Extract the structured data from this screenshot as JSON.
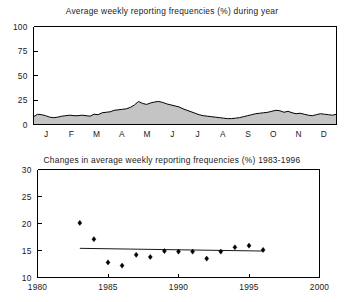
{
  "figure": {
    "background_color": "#ffffff",
    "ink_color": "#000000",
    "fill_color": "#c4c4c4"
  },
  "chart_data": [
    {
      "type": "area",
      "title": "Average weekly reporting frequencies (%) during year",
      "xlabel": "",
      "ylabel": "",
      "ylim": [
        0,
        100
      ],
      "yticks": [
        0,
        25,
        50,
        75,
        100
      ],
      "ytick_labels": [
        "0",
        "25",
        "50",
        "75",
        "100"
      ],
      "categories": [
        "J",
        "F",
        "M",
        "A",
        "M",
        "J",
        "J",
        "A",
        "S",
        "O",
        "N",
        "D"
      ],
      "xtick_labels": [
        "J",
        "F",
        "M",
        "A",
        "M",
        "J",
        "J",
        "A",
        "S",
        "O",
        "N",
        "D"
      ],
      "grid": false,
      "legend": "none",
      "x": [
        0.0,
        1.0,
        2.0,
        3.0,
        4.0,
        5.0,
        6.0,
        7.0,
        8.0,
        9.0,
        10.0,
        11.0,
        12.0,
        13.0,
        14.0,
        15.0,
        16.0,
        17.0,
        18.0,
        19.0,
        20.0,
        21.0,
        22.0,
        23.0,
        24.0,
        25.0,
        26.0,
        27.0,
        28.0,
        29.0,
        30.0,
        31.0,
        32.0,
        33.0,
        34.0,
        35.0,
        36.0,
        37.0,
        38.0,
        39.0,
        40.0,
        41.0,
        42.0,
        43.0,
        44.0,
        45.0,
        46.0,
        47.0,
        48.0,
        49.0,
        50.0,
        51.0
      ],
      "values": [
        8.0,
        10.5,
        10.0,
        9.0,
        7.5,
        7.0,
        7.5,
        8.5,
        9.0,
        9.5,
        9.0,
        9.0,
        9.5,
        9.0,
        8.5,
        10.5,
        10.0,
        12.0,
        12.5,
        13.0,
        14.5,
        15.0,
        15.5,
        16.0,
        17.5,
        20.0,
        23.5,
        21.5,
        20.5,
        22.0,
        23.0,
        23.5,
        22.5,
        21.0,
        20.0,
        19.0,
        18.0,
        16.0,
        14.5,
        13.0,
        11.5,
        10.0,
        9.0,
        8.5,
        8.0,
        7.5,
        7.0,
        6.5,
        6.0,
        6.0,
        6.5,
        7.0
      ],
      "values_tail": [
        8.0,
        9.0,
        10.0,
        11.0,
        11.5,
        12.0,
        12.5,
        13.5,
        14.5,
        14.0,
        12.5,
        13.5,
        12.0,
        11.0,
        11.5,
        10.5,
        9.5,
        9.0,
        10.0,
        11.0,
        10.5,
        10.0,
        9.5,
        10.5
      ],
      "series_note": "weekly values across the 12 months of the year",
      "peak_month": "May",
      "peak_value": 23.5,
      "min_value": 6.0
    },
    {
      "type": "scatter",
      "title": "Changes in average weekly reporting frequencies (%) 1983-1996",
      "xlabel": "",
      "ylabel": "",
      "xlim": [
        1980,
        2000
      ],
      "ylim": [
        10,
        30
      ],
      "yticks": [
        10,
        15,
        20,
        25,
        30
      ],
      "ytick_labels": [
        "10",
        "15",
        "20",
        "25",
        "30"
      ],
      "xticks": [
        1980,
        1985,
        1990,
        1995,
        2000
      ],
      "xtick_labels": [
        "1980",
        "1985",
        "1990",
        "1995",
        "2000"
      ],
      "grid": false,
      "legend": "none",
      "x": [
        1983,
        1984,
        1985,
        1986,
        1987,
        1988,
        1989,
        1990,
        1991,
        1992,
        1993,
        1994,
        1995,
        1996
      ],
      "values": [
        20.1,
        17.1,
        12.8,
        12.2,
        14.2,
        13.8,
        14.9,
        14.8,
        14.8,
        13.5,
        14.8,
        15.6,
        15.9,
        15.1
      ],
      "points": [
        {
          "year": 1983,
          "value": 20.1
        },
        {
          "year": 1984,
          "value": 17.1
        },
        {
          "year": 1985,
          "value": 12.8
        },
        {
          "year": 1986,
          "value": 12.2
        },
        {
          "year": 1987,
          "value": 14.2
        },
        {
          "year": 1988,
          "value": 13.8
        },
        {
          "year": 1989,
          "value": 14.9
        },
        {
          "year": 1990,
          "value": 14.8
        },
        {
          "year": 1991,
          "value": 14.8
        },
        {
          "year": 1992,
          "value": 13.5
        },
        {
          "year": 1993,
          "value": 14.8
        },
        {
          "year": 1994,
          "value": 15.6
        },
        {
          "year": 1995,
          "value": 15.9
        },
        {
          "year": 1996,
          "value": 15.1
        }
      ],
      "trendline": {
        "x_start": 1983,
        "x_end": 1996,
        "y_start": 15.4,
        "y_end": 14.9
      }
    }
  ]
}
